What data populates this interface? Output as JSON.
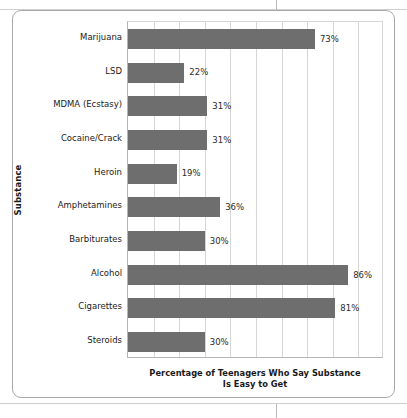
{
  "chart_data": {
    "type": "bar",
    "orientation": "horizontal",
    "title": "",
    "xlabel": "Percentage of Teenagers Who Say Substance Is Easy to Get",
    "xlabel_line1": "Percentage of Teenagers Who Say Substance",
    "xlabel_line2": "Is Easy to Get",
    "ylabel": "Substance",
    "xlim": [
      0,
      100
    ],
    "grid": true,
    "gridline_interval": 10,
    "legend": "none",
    "bar_color": "#6e6e6e",
    "categories": [
      "Marijuana",
      "LSD",
      "MDMA (Ecstasy)",
      "Cocaine/Crack",
      "Heroin",
      "Amphetamines",
      "Barbiturates",
      "Alcohol",
      "Cigarettes",
      "Steroids"
    ],
    "values": [
      73,
      22,
      31,
      31,
      19,
      36,
      30,
      86,
      81,
      30
    ],
    "data_labels": [
      "73%",
      "22%",
      "31%",
      "31%",
      "19%",
      "36%",
      "30%",
      "86%",
      "81%",
      "30%"
    ],
    "points": [
      {
        "category": "Marijuana",
        "value": 73,
        "label": "73%"
      },
      {
        "category": "LSD",
        "value": 22,
        "label": "22%"
      },
      {
        "category": "MDMA (Ecstasy)",
        "value": 31,
        "label": "31%"
      },
      {
        "category": "Cocaine/Crack",
        "value": 31,
        "label": "31%"
      },
      {
        "category": "Heroin",
        "value": 19,
        "label": "19%"
      },
      {
        "category": "Amphetamines",
        "value": 36,
        "label": "36%"
      },
      {
        "category": "Barbiturates",
        "value": 30,
        "label": "30%"
      },
      {
        "category": "Alcohol",
        "value": 86,
        "label": "86%"
      },
      {
        "category": "Cigarettes",
        "value": 81,
        "label": "81%"
      },
      {
        "category": "Steroids",
        "value": 30,
        "label": "30%"
      }
    ]
  }
}
